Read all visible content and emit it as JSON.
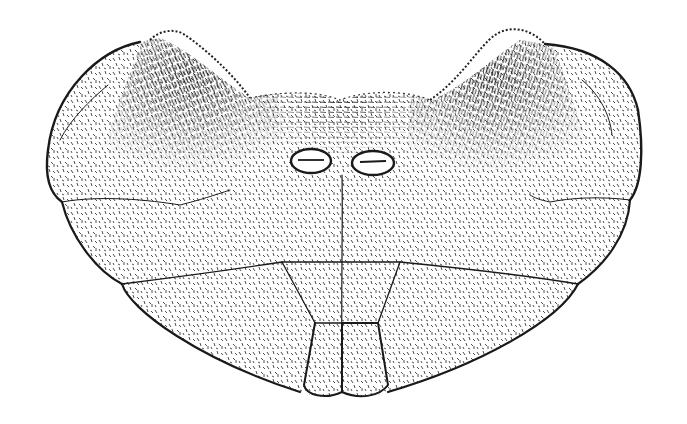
{
  "figure": {
    "style": "black ink stipple drawing on white",
    "colors": {
      "background": "#ffffff",
      "ink": "#1a1a1a",
      "stipple": "#3a3a3a",
      "dense_hatching": "#111111"
    },
    "parts": [
      {
        "id": "left-lateral-lobe",
        "label": ""
      },
      {
        "id": "right-lateral-lobe",
        "label": ""
      },
      {
        "id": "central-plate",
        "label": ""
      },
      {
        "id": "left-opening",
        "label": ""
      },
      {
        "id": "right-opening",
        "label": ""
      },
      {
        "id": "left-lower-plate",
        "label": ""
      },
      {
        "id": "right-lower-plate",
        "label": ""
      },
      {
        "id": "central-trapezoid-left",
        "label": ""
      },
      {
        "id": "central-trapezoid-right",
        "label": ""
      },
      {
        "id": "terminal-lobe-left",
        "label": ""
      },
      {
        "id": "terminal-lobe-right",
        "label": ""
      },
      {
        "id": "left-hair-tuft",
        "label": ""
      },
      {
        "id": "right-hair-tuft",
        "label": ""
      },
      {
        "id": "central-hair-band",
        "label": ""
      }
    ]
  }
}
